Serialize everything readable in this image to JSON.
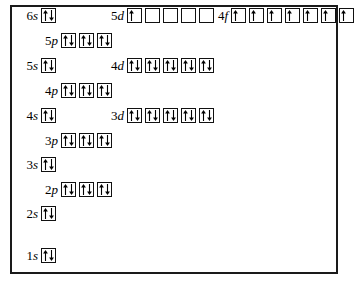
{
  "figure": {
    "kind": "orbital-filling-diagram",
    "border_color": "#1a1a1a",
    "arrow_color": "#000000",
    "box_border_color": "#111111",
    "background": "#ffffff"
  },
  "rows": [
    {
      "id": "row-6s-5d-4f",
      "top": 8,
      "groups": [
        {
          "name": "6s",
          "label_n": "6",
          "label_l": "s",
          "label_left": 4,
          "label_width": 22,
          "boxes": [
            "pair"
          ]
        },
        {
          "name": "5d",
          "label_n": "5",
          "label_l": "d",
          "label_left": 88,
          "label_width": 24,
          "boxes": [
            "up",
            "empty",
            "empty",
            "empty",
            "empty"
          ]
        },
        {
          "name": "4f",
          "label_n": "4",
          "label_l": "f",
          "label_left": 196,
          "label_width": 20,
          "boxes": [
            "up",
            "up",
            "up",
            "up",
            "up",
            "up",
            "up"
          ]
        }
      ]
    },
    {
      "id": "row-5p",
      "top": 33,
      "groups": [
        {
          "name": "5p",
          "label_n": "5",
          "label_l": "p",
          "label_left": 22,
          "label_width": 24,
          "boxes": [
            "pair",
            "pair",
            "pair"
          ]
        }
      ]
    },
    {
      "id": "row-5s-4d",
      "top": 58,
      "groups": [
        {
          "name": "5s",
          "label_n": "5",
          "label_l": "s",
          "label_left": 4,
          "label_width": 22,
          "boxes": [
            "pair"
          ]
        },
        {
          "name": "4d",
          "label_n": "4",
          "label_l": "d",
          "label_left": 88,
          "label_width": 24,
          "boxes": [
            "pair",
            "pair",
            "pair",
            "pair",
            "pair"
          ]
        }
      ]
    },
    {
      "id": "row-4p",
      "top": 83,
      "groups": [
        {
          "name": "4p",
          "label_n": "4",
          "label_l": "p",
          "label_left": 22,
          "label_width": 24,
          "boxes": [
            "pair",
            "pair",
            "pair"
          ]
        }
      ]
    },
    {
      "id": "row-4s-3d",
      "top": 108,
      "groups": [
        {
          "name": "4s",
          "label_n": "4",
          "label_l": "s",
          "label_left": 4,
          "label_width": 22,
          "boxes": [
            "pair"
          ]
        },
        {
          "name": "3d",
          "label_n": "3",
          "label_l": "d",
          "label_left": 88,
          "label_width": 24,
          "boxes": [
            "pair",
            "pair",
            "pair",
            "pair",
            "pair"
          ]
        }
      ]
    },
    {
      "id": "row-3p",
      "top": 133,
      "groups": [
        {
          "name": "3p",
          "label_n": "3",
          "label_l": "p",
          "label_left": 22,
          "label_width": 24,
          "boxes": [
            "pair",
            "pair",
            "pair"
          ]
        }
      ]
    },
    {
      "id": "row-3s",
      "top": 157,
      "groups": [
        {
          "name": "3s",
          "label_n": "3",
          "label_l": "s",
          "label_left": 4,
          "label_width": 22,
          "boxes": [
            "pair"
          ]
        }
      ]
    },
    {
      "id": "row-2p",
      "top": 182,
      "groups": [
        {
          "name": "2p",
          "label_n": "2",
          "label_l": "p",
          "label_left": 22,
          "label_width": 24,
          "boxes": [
            "pair",
            "pair",
            "pair"
          ]
        }
      ]
    },
    {
      "id": "row-2s",
      "top": 206,
      "groups": [
        {
          "name": "2s",
          "label_n": "2",
          "label_l": "s",
          "label_left": 4,
          "label_width": 22,
          "boxes": [
            "pair"
          ]
        }
      ]
    },
    {
      "id": "row-1s",
      "top": 248,
      "groups": [
        {
          "name": "1s",
          "label_n": "1",
          "label_l": "s",
          "label_left": 4,
          "label_width": 22,
          "boxes": [
            "pair"
          ]
        }
      ]
    }
  ]
}
